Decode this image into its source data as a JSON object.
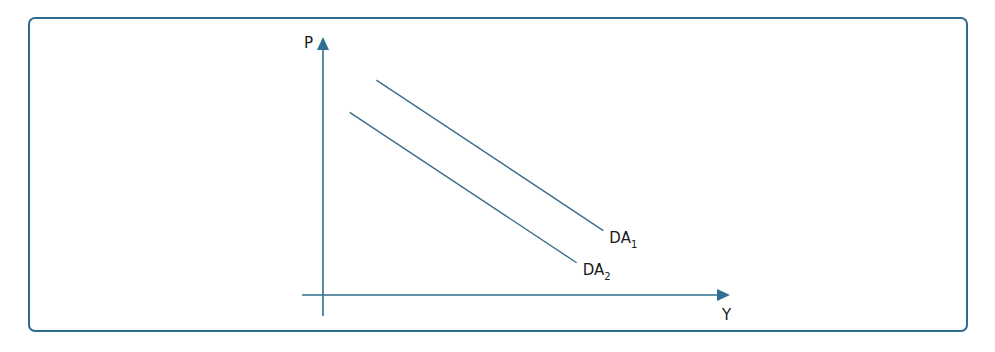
{
  "chart_data": {
    "type": "line",
    "title": "",
    "xlabel": "Y",
    "ylabel": "P",
    "xlim": [
      0,
      10
    ],
    "ylim": [
      0,
      10
    ],
    "grid": false,
    "series": [
      {
        "name": "DA1",
        "label_main": "DA",
        "label_sub": "1",
        "x": [
          1.2,
          6.3
        ],
        "y": [
          8.0,
          2.4
        ]
      },
      {
        "name": "DA2",
        "label_main": "DA",
        "label_sub": "2",
        "x": [
          0.6,
          5.7
        ],
        "y": [
          6.8,
          1.2
        ]
      }
    ]
  },
  "colors": {
    "frame": "#2f6a90",
    "axis": "#2f6f8f",
    "curve": "#3a6e8c",
    "text": "#1a1a1a"
  }
}
